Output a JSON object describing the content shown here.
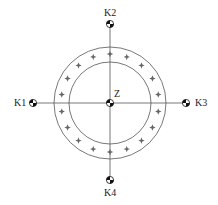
{
  "diagram": {
    "center": {
      "x": 110,
      "y": 103
    },
    "outer_circle_radius": 56,
    "inner_circle_radius": 41,
    "star_ring_radius": 49,
    "star_count": 18,
    "star_start_angle_deg": 0,
    "line_color": "#555555",
    "star_color": "#666666",
    "marker_color": "#111111",
    "center_label": "Z",
    "points": [
      {
        "id": "K1",
        "label": "K1",
        "x": 33,
        "y": 103
      },
      {
        "id": "K2",
        "label": "K2",
        "x": 110,
        "y": 24
      },
      {
        "id": "K3",
        "label": "K3",
        "x": 186,
        "y": 103
      },
      {
        "id": "K4",
        "label": "K4",
        "x": 110,
        "y": 180
      }
    ]
  }
}
